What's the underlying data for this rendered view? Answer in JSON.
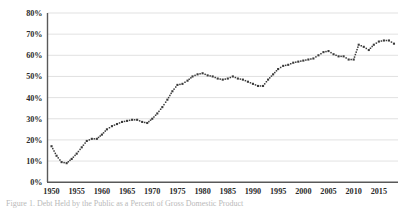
{
  "chart_data": {
    "type": "line",
    "title": "",
    "subtitle": "",
    "xlabel": "",
    "ylabel": "Percent of GDP",
    "xlim": [
      1950,
      2018
    ],
    "ylim": [
      0,
      0.8
    ],
    "grid": true,
    "legend": false,
    "legend_position": "none",
    "marker": "dotted-square",
    "series_color": "#3a3a3a",
    "gridline_color": "#d9d9d9",
    "axis_color": "#595959",
    "y_tick_labels": [
      "0%",
      "10%",
      "20%",
      "30%",
      "40%",
      "50%",
      "60%",
      "70%",
      "80%"
    ],
    "y_tick_values": [
      0,
      10,
      20,
      30,
      40,
      50,
      60,
      70,
      80
    ],
    "x_tick_labels": [
      "1950",
      "1955",
      "1960",
      "1965",
      "1970",
      "1975",
      "1980",
      "1985",
      "1990",
      "1995",
      "2000",
      "2005",
      "2010",
      "2015"
    ],
    "x_tick_values": [
      1950,
      1955,
      1960,
      1965,
      1970,
      1975,
      1980,
      1985,
      1990,
      1995,
      2000,
      2005,
      2010,
      2015
    ],
    "x": [
      1950,
      1951,
      1952,
      1953,
      1954,
      1955,
      1956,
      1957,
      1958,
      1959,
      1960,
      1961,
      1962,
      1963,
      1964,
      1965,
      1966,
      1967,
      1968,
      1969,
      1970,
      1971,
      1972,
      1973,
      1974,
      1975,
      1976,
      1977,
      1978,
      1979,
      1980,
      1981,
      1982,
      1983,
      1984,
      1985,
      1986,
      1987,
      1988,
      1989,
      1990,
      1991,
      1992,
      1993,
      1994,
      1995,
      1996,
      1997,
      1998,
      1999,
      2000,
      2001,
      2002,
      2003,
      2004,
      2005,
      2006,
      2007,
      2008,
      2009,
      2010,
      2011,
      2012,
      2013,
      2014,
      2015,
      2016,
      2017,
      2018
    ],
    "series": [
      {
        "name": "Percent of GDP",
        "values": [
          17.0,
          12.5,
          9.5,
          9.0,
          11.0,
          13.5,
          16.5,
          19.5,
          20.5,
          20.5,
          22.5,
          25.0,
          26.5,
          27.5,
          28.5,
          29.0,
          29.5,
          29.5,
          28.5,
          28.0,
          30.0,
          32.5,
          35.5,
          39.0,
          43.0,
          46.0,
          46.5,
          48.0,
          50.0,
          51.0,
          51.5,
          50.5,
          50.0,
          49.0,
          48.5,
          49.0,
          50.0,
          49.0,
          48.5,
          47.5,
          46.5,
          45.5,
          45.5,
          48.5,
          51.0,
          53.5,
          55.0,
          55.5,
          56.5,
          57.0,
          57.5,
          58.0,
          58.5,
          60.0,
          61.5,
          62.0,
          60.5,
          59.5,
          59.5,
          58.0,
          58.0,
          65.0,
          64.0,
          62.5,
          65.0,
          66.5,
          67.0,
          67.0,
          65.5
        ]
      }
    ],
    "annotations": []
  },
  "caption": {
    "partial_text": "Figure 1. Debt Held by the Public as a Percent of Gross Domestic Product"
  }
}
